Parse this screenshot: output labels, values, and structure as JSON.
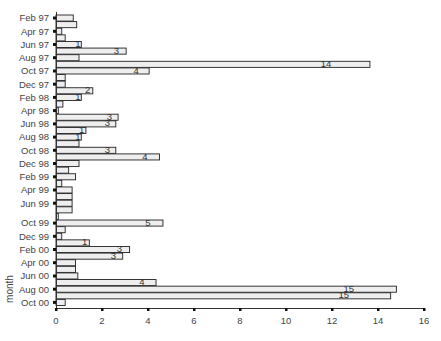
{
  "chart_data": {
    "type": "bar",
    "orientation": "horizontal",
    "title": "",
    "xlabel": "",
    "ylabel": "month",
    "xlim": [
      0,
      16
    ],
    "xticks": [
      0,
      2,
      4,
      6,
      8,
      10,
      12,
      14,
      16
    ],
    "grid": false,
    "legend": null,
    "ytick_labels": [
      "Feb 97",
      "Apr 97",
      "Jun 97",
      "Aug 97",
      "Oct 97",
      "Dec 97",
      "Feb 98",
      "Apr 98",
      "Jun 98",
      "Aug 98",
      "Oct 98",
      "Dec 98",
      "Feb 99",
      "Apr 99",
      "Jun 99",
      "Oct 99",
      "Dec 99",
      "Feb 00",
      "Apr 00",
      "Jun 00",
      "Aug 00",
      "Oct 00"
    ],
    "bars": [
      {
        "label_tick": "Feb 97",
        "value": 0.75,
        "text": ""
      },
      {
        "label_tick": "",
        "value": 0.9,
        "text": ""
      },
      {
        "label_tick": "Apr 97",
        "value": 0.25,
        "text": ""
      },
      {
        "label_tick": "",
        "value": 0.4,
        "text": ""
      },
      {
        "label_tick": "Jun 97",
        "value": 1.1,
        "text": "1"
      },
      {
        "label_tick": "",
        "value": 3.05,
        "text": "3"
      },
      {
        "label_tick": "Aug 97",
        "value": 1.0,
        "text": ""
      },
      {
        "label_tick": "",
        "value": 13.65,
        "text": "14"
      },
      {
        "label_tick": "Oct 97",
        "value": 4.05,
        "text": "4"
      },
      {
        "label_tick": "",
        "value": 0.4,
        "text": ""
      },
      {
        "label_tick": "Dec 97",
        "value": 0.4,
        "text": ""
      },
      {
        "label_tick": "",
        "value": 1.6,
        "text": "2"
      },
      {
        "label_tick": "Feb 98",
        "value": 1.1,
        "text": "1"
      },
      {
        "label_tick": "",
        "value": 0.3,
        "text": ""
      },
      {
        "label_tick": "Apr 98",
        "value": 0.1,
        "text": ""
      },
      {
        "label_tick": "",
        "value": 2.7,
        "text": "3"
      },
      {
        "label_tick": "Jun 98",
        "value": 2.6,
        "text": "3"
      },
      {
        "label_tick": "",
        "value": 1.3,
        "text": "1"
      },
      {
        "label_tick": "Aug 98",
        "value": 1.1,
        "text": "1"
      },
      {
        "label_tick": "",
        "value": 1.0,
        "text": ""
      },
      {
        "label_tick": "Oct 98",
        "value": 2.6,
        "text": "3"
      },
      {
        "label_tick": "",
        "value": 4.5,
        "text": "4"
      },
      {
        "label_tick": "Dec 98",
        "value": 1.0,
        "text": ""
      },
      {
        "label_tick": "",
        "value": 0.55,
        "text": ""
      },
      {
        "label_tick": "Feb 99",
        "value": 0.85,
        "text": ""
      },
      {
        "label_tick": "",
        "value": 0.25,
        "text": ""
      },
      {
        "label_tick": "Apr 99",
        "value": 0.7,
        "text": ""
      },
      {
        "label_tick": "",
        "value": 0.7,
        "text": ""
      },
      {
        "label_tick": "Jun 99",
        "value": 0.7,
        "text": ""
      },
      {
        "label_tick": "",
        "value": 0.7,
        "text": ""
      },
      {
        "label_tick": "",
        "value": 0.1,
        "text": ""
      },
      {
        "label_tick": "Oct 99",
        "value": 4.65,
        "text": "5"
      },
      {
        "label_tick": "",
        "value": 0.4,
        "text": ""
      },
      {
        "label_tick": "Dec 99",
        "value": 0.25,
        "text": ""
      },
      {
        "label_tick": "",
        "value": 1.45,
        "text": "1"
      },
      {
        "label_tick": "Feb 00",
        "value": 3.2,
        "text": "3"
      },
      {
        "label_tick": "",
        "value": 2.9,
        "text": "3"
      },
      {
        "label_tick": "Apr 00",
        "value": 0.85,
        "text": ""
      },
      {
        "label_tick": "",
        "value": 0.85,
        "text": ""
      },
      {
        "label_tick": "Jun 00",
        "value": 0.95,
        "text": ""
      },
      {
        "label_tick": "",
        "value": 4.35,
        "text": "4"
      },
      {
        "label_tick": "Aug 00",
        "value": 14.8,
        "text": "15"
      },
      {
        "label_tick": "",
        "value": 14.55,
        "text": "15"
      },
      {
        "label_tick": "Oct 00",
        "value": 0.4,
        "text": ""
      }
    ]
  }
}
